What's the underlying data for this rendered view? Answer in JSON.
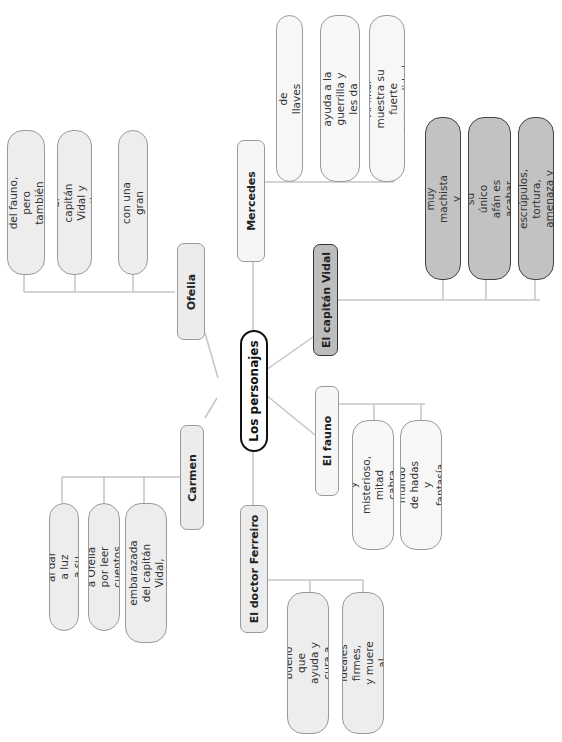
{
  "diagram": {
    "center": "Los personajes",
    "branches": [
      {
        "name": "Ofelia",
        "leaves": [
          "Participa en las pruebas\ndel fauno, pero también\nle desobedece",
          "No soporta al capitán\nVidal y cuestiona a su madre",
          "Una niña con una gran\nimaginación"
        ]
      },
      {
        "name": "Mercedes",
        "leaves": [
          "El ama de llaves del molino",
          "Muy reservada, ayuda a la\nguerrilla y les da\ninformación y víveres",
          "Al final muestra su fuerte\npersonalidad"
        ]
      },
      {
        "name": "El capitán Vidal",
        "leaves": [
          "Un hombre muy machista y\npoco afectuoso",
          "Le encanta la precisión; su\núnico afán es acabar con la\nguerrilla de las montañas",
          "Sin escrúpulos, tortura,\namenaza y mata"
        ]
      },
      {
        "name": "El fauno",
        "leaves": [
          "Un ser mitológico y\nmisterioso, mitad cabra\nmitad hombre",
          "Lleva a Ofelia a un\nmundo de hadas y fantasía\nmediante tres pruebas"
        ]
      },
      {
        "name": "El doctor Ferreiro",
        "leaves": [
          "Un hombre servicial y\nbueno que ayuda y cura a\nlos hombres de la guerrilla",
          "Tiene unos ideales firmes,\ny muere al dispararle Vidal"
        ]
      },
      {
        "name": "Carmen",
        "leaves": [
          "Muere al dar a luz a su hijo",
          "Realista, regaña a Ofelia\npor leer cuentos de hadas",
          "La madre de Ofelia,\nembarazada del capitán\nVidal, enferma y muy débil"
        ]
      }
    ]
  },
  "colors": {
    "line": "#c4c4c4",
    "node_fill": "#ececec",
    "vidal_fill": "#bdbdbd",
    "center_border": "#111111"
  }
}
